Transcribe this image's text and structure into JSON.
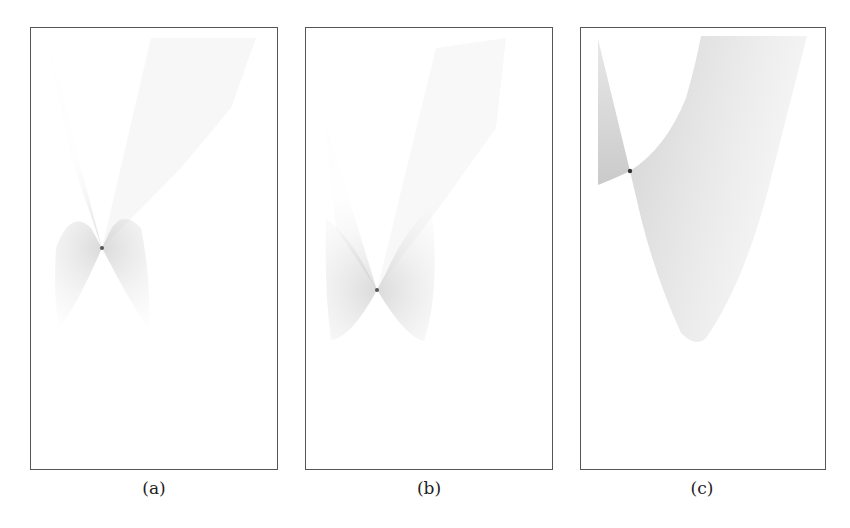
{
  "figure": {
    "panels": [
      {
        "id": "a",
        "caption": "(a)",
        "frame": {
          "x": 30,
          "y": 27,
          "w": 248,
          "h": 443
        },
        "caustic_point": {
          "x": 101,
          "y": 247
        },
        "description": "Symmetric X-shaped ray caustic with faint fans extending to top-right"
      },
      {
        "id": "b",
        "caption": "(b)",
        "frame": {
          "x": 305,
          "y": 27,
          "w": 248,
          "h": 443
        },
        "caustic_point": {
          "x": 376,
          "y": 289
        },
        "description": "V/X-shaped caustic lower in frame with rounded lower lobes"
      },
      {
        "id": "c",
        "caption": "(c)",
        "frame": {
          "x": 580,
          "y": 27,
          "w": 246,
          "h": 443
        },
        "caustic_point": {
          "x": 629,
          "y": 170
        },
        "description": "Asymmetric caustic: thin left spike and large right fan curving to a rounded bottom lobe"
      }
    ],
    "colors": {
      "frame": "#555555",
      "density_dark": "#333333",
      "density_light": "#dddddd",
      "background": "#ffffff"
    }
  }
}
